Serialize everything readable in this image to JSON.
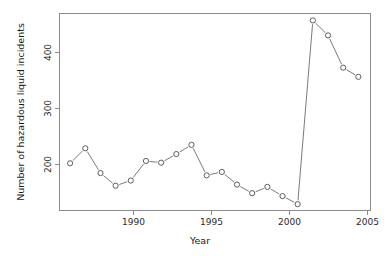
{
  "chart_data": {
    "type": "line",
    "title": "",
    "xlabel": "Year",
    "ylabel": "Number of hazardous liquid incidents",
    "x": [
      1986,
      1987,
      1988,
      1989,
      1990,
      1991,
      1992,
      1993,
      1994,
      1995,
      1996,
      1997,
      1998,
      1999,
      2000,
      2001,
      2002,
      2003,
      2004,
      2005
    ],
    "values": [
      210,
      236,
      193,
      171,
      180,
      214,
      211,
      226,
      242,
      189,
      195,
      173,
      158,
      169,
      153,
      139,
      458,
      432,
      376,
      360
    ],
    "xlim": [
      1985.3,
      2005.8
    ],
    "ylim": [
      128,
      470
    ],
    "xticks": [
      1990,
      1995,
      2000,
      2005
    ],
    "xtick_labels": [
      "1990",
      "1995",
      "2000",
      "2005"
    ],
    "yticks": [
      200,
      300,
      400
    ],
    "ytick_labels": [
      "200",
      "300",
      "400"
    ],
    "grid": false,
    "legend": false,
    "marker": "open-circle",
    "series_color": "#6b6b6b",
    "frame_color": "#8c8c8c",
    "background": "#ffffff"
  }
}
